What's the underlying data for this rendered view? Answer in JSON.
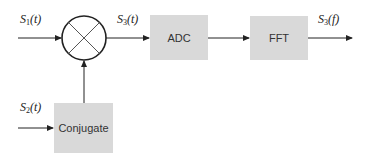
{
  "diagram": {
    "type": "signal-processing-block-diagram",
    "colors": {
      "block_fill": "#d9d9d9",
      "line": "#222222",
      "text": "#333333"
    },
    "blocks": [
      {
        "id": "mixer",
        "label": "",
        "shape": "circle-with-x"
      },
      {
        "id": "adc",
        "label": "ADC"
      },
      {
        "id": "fft",
        "label": "FFT"
      },
      {
        "id": "conjugate",
        "label": "Conjugate"
      }
    ],
    "signals": {
      "s1": {
        "base": "S",
        "sub": "1",
        "arg": "(t)"
      },
      "s3t": {
        "base": "S",
        "sub": "3",
        "arg": "(t)"
      },
      "s3f": {
        "base": "S",
        "sub": "3",
        "arg": "(f)"
      },
      "s2": {
        "base": "S",
        "sub": "2",
        "arg": "(t)"
      }
    },
    "edges": [
      {
        "from": "input-s1",
        "to": "mixer",
        "label": "S1(t)"
      },
      {
        "from": "mixer",
        "to": "adc",
        "label": "S3(t)"
      },
      {
        "from": "adc",
        "to": "fft",
        "label": ""
      },
      {
        "from": "fft",
        "to": "output",
        "label": "S3(f)"
      },
      {
        "from": "input-s2",
        "to": "conjugate",
        "label": "S2(t)"
      },
      {
        "from": "conjugate",
        "to": "mixer",
        "label": ""
      }
    ]
  }
}
